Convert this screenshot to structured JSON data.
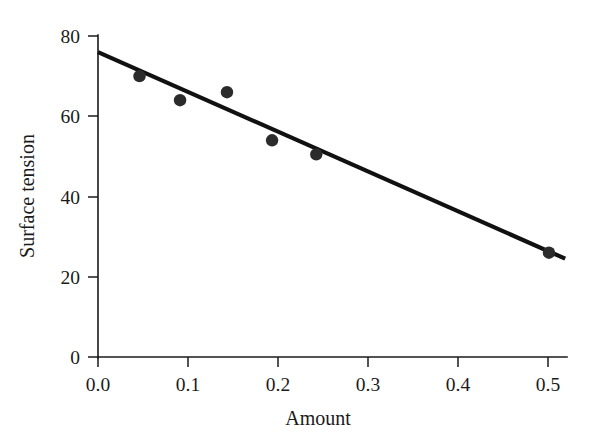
{
  "chart_data": {
    "type": "scatter",
    "title": "",
    "subtitle": "",
    "xlabel": "Amount",
    "ylabel": "Surface tension",
    "xlim": [
      0.0,
      0.52
    ],
    "ylim": [
      0,
      80
    ],
    "grid": false,
    "legend": null,
    "x_ticks": [
      0.0,
      0.1,
      0.2,
      0.3,
      0.4,
      0.5
    ],
    "x_tick_labels": [
      "0.0",
      "0.1",
      "0.2",
      "0.3",
      "0.4",
      "0.5"
    ],
    "y_ticks": [
      0,
      20,
      40,
      60,
      80
    ],
    "y_tick_labels": [
      "0",
      "20",
      "40",
      "60",
      "80"
    ],
    "x": [
      0.046,
      0.091,
      0.143,
      0.193,
      0.242,
      0.5
    ],
    "y": [
      70,
      64,
      66,
      54,
      50.5,
      26
    ],
    "points": [
      {
        "x": 0.046,
        "y": 70
      },
      {
        "x": 0.091,
        "y": 64
      },
      {
        "x": 0.143,
        "y": 66
      },
      {
        "x": 0.193,
        "y": 54
      },
      {
        "x": 0.242,
        "y": 50.5
      },
      {
        "x": 0.5,
        "y": 26
      }
    ],
    "series": [
      {
        "name": "observations",
        "type": "scatter",
        "marker": "filled-circle",
        "marker_size": 9,
        "color": "#2b2b2b",
        "values": [
          70,
          64,
          66,
          54,
          50.5,
          26
        ]
      },
      {
        "name": "fitted-line",
        "type": "line",
        "color": "#111111",
        "line_width": 4.2,
        "x_start": 0.0,
        "y_start": 76.0,
        "x_end": 0.518,
        "y_end": 24.5,
        "slope": -99.4,
        "intercept": 76.0
      }
    ],
    "annotations": [],
    "colors": {
      "axis": "#1a1a1a",
      "marker": "#2b2b2b",
      "line": "#111111",
      "background": "#ffffff"
    }
  }
}
